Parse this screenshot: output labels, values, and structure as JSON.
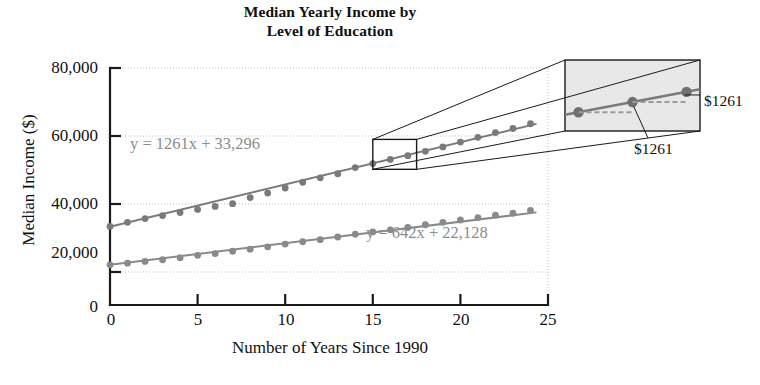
{
  "chart_data": {
    "type": "scatter",
    "title": "Median Yearly Income by Level of Education",
    "title_line1": "Median Yearly Income by",
    "title_line2": "Level of Education",
    "xlabel": "Number of Years Since 1990",
    "ylabel": "Median Income ($)",
    "xlim": [
      0,
      25
    ],
    "ylim": [
      0,
      80000
    ],
    "xticks": [
      0,
      5,
      10,
      15,
      20,
      25
    ],
    "xtick_labels": [
      "0",
      "5",
      "10",
      "15",
      "20",
      "25"
    ],
    "yticks": [
      0,
      20000,
      40000,
      60000,
      80000
    ],
    "ytick_labels": [
      "0",
      "20,000",
      "40,000",
      "60,000",
      "80,000"
    ],
    "grid": "horizontal-dotted",
    "legend": "none",
    "series": [
      {
        "name": "Bachelor's degree or higher",
        "color": "#7a7a7a",
        "equation_text": "y = 1261x + 33,296",
        "equation_slope": 1261,
        "equation_intercept": 33296,
        "x": [
          0,
          1,
          2,
          3,
          4,
          5,
          6,
          7,
          8,
          9,
          10,
          11,
          12,
          13,
          14,
          15,
          16,
          17,
          18,
          19,
          20,
          21,
          22,
          23,
          24
        ],
        "values": [
          33400,
          34600,
          35700,
          36600,
          37500,
          38400,
          39300,
          40100,
          41900,
          43200,
          44700,
          46400,
          47700,
          48900,
          50700,
          51900,
          53100,
          54200,
          55500,
          56800,
          58200,
          59600,
          61000,
          62200,
          63600
        ]
      },
      {
        "name": "High school diploma",
        "color": "#8a8a8a",
        "equation_text": "y = 642x + 22,128",
        "equation_slope": 642,
        "equation_intercept": 22128,
        "x": [
          0,
          1,
          2,
          3,
          4,
          5,
          6,
          7,
          8,
          9,
          10,
          11,
          12,
          13,
          14,
          15,
          16,
          17,
          18,
          19,
          20,
          21,
          22,
          23,
          24
        ],
        "values": [
          22100,
          22600,
          23100,
          23600,
          24200,
          24900,
          25400,
          26100,
          26700,
          27400,
          28200,
          28900,
          29500,
          30300,
          31100,
          31800,
          32400,
          33100,
          33900,
          34600,
          35300,
          36000,
          36700,
          37300,
          38100
        ]
      }
    ],
    "annotations": {
      "zoom_source_rect": {
        "x0": 15.0,
        "x1": 17.5,
        "y0": 50200,
        "y1": 59000
      },
      "callout_labels": [
        "1 yr",
        "1 yr",
        "$1261",
        "$1261"
      ],
      "rise_label": "$1261",
      "run_label": "1 yr"
    }
  },
  "callout": {
    "run_label_1": "1 yr",
    "run_label_2": "1 yr",
    "rise_label_right": "$1261",
    "rise_label_bottom": "$1261"
  },
  "colors": {
    "series_gray": "#7a7a7a",
    "equation_gray": "#8c8c8c",
    "axis_black": "#1a1a1a",
    "grid_dotted": "#bdbdbd",
    "callout_fill": "#e8e8e8"
  }
}
